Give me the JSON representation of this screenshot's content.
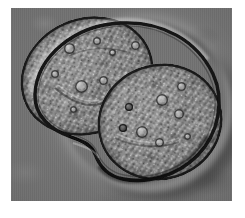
{
  "image": {
    "kind": "light-microscopy-micrograph",
    "modality": "differential-interference-contrast",
    "color_mode": "grayscale",
    "subject": "dividing-cell",
    "caption": "",
    "frame": {
      "x": 11,
      "y": 8,
      "width": 221,
      "height": 193
    }
  },
  "colors": {
    "page_background": "#ffffff",
    "field_background": "#6e6e6e",
    "cytoplasm_light": "#9a9a9a",
    "cytoplasm_mid": "#828282",
    "cytoplasm_dark": "#6b6b6b",
    "membrane_outline": "#141414",
    "halo_highlight": "#c8c8c8",
    "shadow": "#3a3a3a"
  },
  "cell": {
    "label": "",
    "lobes": [
      {
        "name": "upper-left-lobe",
        "cx": 76,
        "cy": 68,
        "rx": 68,
        "ry": 58,
        "rotation": -24
      },
      {
        "name": "lower-right-lobe",
        "cx": 149,
        "cy": 114,
        "rx": 63,
        "ry": 58,
        "rotation": -18
      }
    ],
    "cleavage_furrow": {
      "name": "cleavage-furrow",
      "x": 96,
      "y": 138
    },
    "organelles": [
      {
        "name": "vacuole",
        "x": 58,
        "y": 40,
        "d": 11,
        "tone": "light"
      },
      {
        "name": "vacuole",
        "x": 86,
        "y": 33,
        "d": 8,
        "tone": "light"
      },
      {
        "name": "vacuole",
        "x": 101,
        "y": 44,
        "d": 7,
        "tone": "light"
      },
      {
        "name": "vacuole",
        "x": 124,
        "y": 37,
        "d": 9,
        "tone": "light"
      },
      {
        "name": "vacuole",
        "x": 44,
        "y": 66,
        "d": 8,
        "tone": "light"
      },
      {
        "name": "vacuole",
        "x": 70,
        "y": 78,
        "d": 13,
        "tone": "light"
      },
      {
        "name": "vacuole",
        "x": 92,
        "y": 72,
        "d": 9,
        "tone": "light"
      },
      {
        "name": "vacuole",
        "x": 62,
        "y": 101,
        "d": 7,
        "tone": "light"
      },
      {
        "name": "vacuole",
        "x": 118,
        "y": 99,
        "d": 8,
        "tone": "dark"
      },
      {
        "name": "vacuole",
        "x": 151,
        "y": 92,
        "d": 12,
        "tone": "light"
      },
      {
        "name": "vacuole",
        "x": 170,
        "y": 78,
        "d": 9,
        "tone": "light"
      },
      {
        "name": "vacuole",
        "x": 168,
        "y": 106,
        "d": 10,
        "tone": "light"
      },
      {
        "name": "vacuole",
        "x": 131,
        "y": 124,
        "d": 12,
        "tone": "light"
      },
      {
        "name": "vacuole",
        "x": 148,
        "y": 134,
        "d": 9,
        "tone": "light"
      },
      {
        "name": "vacuole",
        "x": 112,
        "y": 120,
        "d": 8,
        "tone": "dark"
      },
      {
        "name": "vacuole",
        "x": 176,
        "y": 128,
        "d": 7,
        "tone": "light"
      }
    ],
    "internal_folds": [
      {
        "name": "cytoplasmic-fold-left"
      },
      {
        "name": "cytoplasmic-fold-lower"
      }
    ]
  }
}
